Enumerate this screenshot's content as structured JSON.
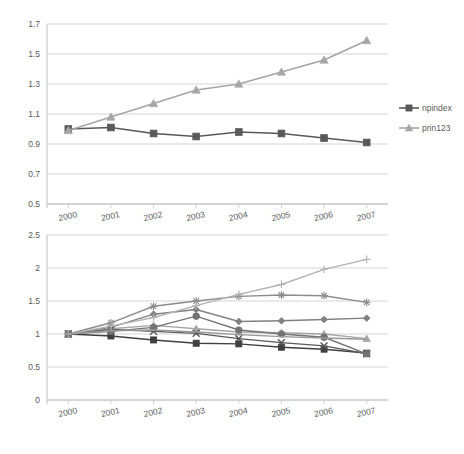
{
  "chart_data": [
    {
      "type": "line",
      "title": "",
      "xlabel": "",
      "ylabel": "",
      "x": [
        "2000",
        "2001",
        "2002",
        "2003",
        "2004",
        "2005",
        "2006",
        "2007"
      ],
      "ylim": [
        0.5,
        1.7
      ],
      "yticks": [
        "0.5",
        "0.7",
        "0.9",
        "1.1",
        "1.3",
        "1.5",
        "1.7"
      ],
      "grid": true,
      "legend_position": "right",
      "series": [
        {
          "name": "npindex",
          "marker": "square",
          "color": "#595959",
          "values": [
            1.0,
            1.01,
            0.97,
            0.95,
            0.98,
            0.97,
            0.94,
            0.91
          ]
        },
        {
          "name": "prin123",
          "marker": "triangle",
          "color": "#a6a6a6",
          "values": [
            0.99,
            1.08,
            1.17,
            1.26,
            1.3,
            1.38,
            1.46,
            1.59
          ]
        }
      ]
    },
    {
      "type": "line",
      "title": "",
      "xlabel": "",
      "ylabel": "",
      "x": [
        "2000",
        "2001",
        "2002",
        "2003",
        "2004",
        "2005",
        "2006",
        "2007"
      ],
      "ylim": [
        0,
        2.5
      ],
      "yticks": [
        "0",
        "0.5",
        "1",
        "1.5",
        "2",
        "2.5"
      ],
      "grid": true,
      "legend_position": "right",
      "series": [
        {
          "name": "Den-np",
          "marker": "diamond",
          "color": "#808080",
          "values": [
            1.0,
            1.1,
            1.3,
            1.37,
            1.19,
            1.2,
            1.22,
            1.24
          ]
        },
        {
          "name": "Fin-np",
          "marker": "square",
          "color": "#404040",
          "values": [
            1.0,
            0.97,
            0.91,
            0.86,
            0.85,
            0.8,
            0.77,
            0.71
          ]
        },
        {
          "name": "Nor-np",
          "marker": "triangle",
          "color": "#a6a6a6",
          "values": [
            1.0,
            1.08,
            1.13,
            1.08,
            1.03,
            1.02,
            1.0,
            0.93
          ]
        },
        {
          "name": "Swe-np",
          "marker": "cross-x",
          "color": "#595959",
          "values": [
            1.0,
            1.07,
            1.04,
            1.01,
            0.93,
            0.87,
            0.82,
            0.7
          ]
        },
        {
          "name": "Den-p",
          "marker": "asterisk",
          "color": "#8c8c8c",
          "values": [
            1.0,
            1.17,
            1.42,
            1.5,
            1.57,
            1.59,
            1.58,
            1.48
          ]
        },
        {
          "name": "Fin-p",
          "marker": "circle",
          "color": "#737373",
          "values": [
            1.0,
            1.04,
            1.1,
            1.27,
            1.06,
            1.0,
            0.95,
            0.7
          ]
        },
        {
          "name": "Nor-p",
          "marker": "plus",
          "color": "#b3b3b3",
          "values": [
            1.0,
            1.12,
            1.25,
            1.43,
            1.6,
            1.75,
            1.98,
            2.13
          ]
        },
        {
          "name": "Swe-p",
          "marker": "none",
          "color": "#999999",
          "values": [
            1.0,
            1.05,
            1.06,
            1.03,
            0.99,
            0.96,
            0.94,
            0.92
          ]
        }
      ]
    }
  ],
  "charts": {
    "top": {
      "legend_items": [
        {
          "label": "npindex"
        },
        {
          "label": "prin123"
        }
      ]
    },
    "bottom": {
      "legend_items": [
        {
          "label": "Den-np"
        },
        {
          "label": "Fin-np"
        },
        {
          "label": "Nor-np"
        },
        {
          "label": "Swe-np"
        },
        {
          "label": "Den-p"
        },
        {
          "label": "Fin-p"
        },
        {
          "label": "Nor-p"
        },
        {
          "label": "Swe-p"
        }
      ]
    }
  }
}
